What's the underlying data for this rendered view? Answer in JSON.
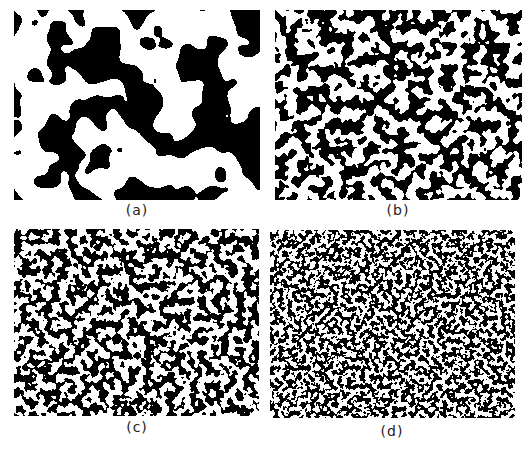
{
  "figure": {
    "panels": [
      {
        "id": "a",
        "label": "(a)",
        "texture": "coarse binary noise",
        "base_frequency": 0.028,
        "seed": 3
      },
      {
        "id": "b",
        "label": "(b)",
        "texture": "medium binary noise",
        "base_frequency": 0.09,
        "seed": 7
      },
      {
        "id": "c",
        "label": "(c)",
        "texture": "fine binary noise",
        "base_frequency": 0.13,
        "seed": 11
      },
      {
        "id": "d",
        "label": "(d)",
        "texture": "very fine binary noise",
        "base_frequency": 0.22,
        "seed": 19
      }
    ],
    "colors": {
      "foreground": "#ffffff",
      "background": "#000000",
      "page": "#ffffff"
    }
  }
}
